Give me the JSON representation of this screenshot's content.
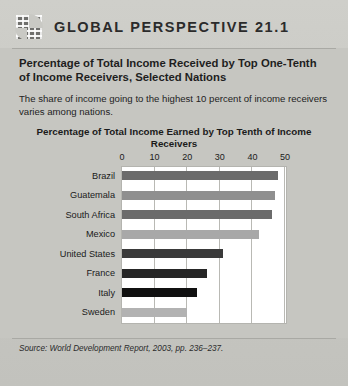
{
  "header": {
    "icon": "globe-grid-icon",
    "title": "GLOBAL PERSPECTIVE 21.1"
  },
  "box": {
    "subtitle": "Percentage of Total Income Received by Top One-Tenth of Income Receivers, Selected Nations",
    "lede": "The share of income going to the highest 10 percent of income receivers varies among nations.",
    "source": "Source: World Development Report, 2003, pp. 236–237."
  },
  "chart_data": {
    "type": "bar",
    "orientation": "horizontal",
    "title": "Percentage of Total Income Earned by Top Tenth of Income Receivers",
    "xlabel": "",
    "ylabel": "",
    "xlim": [
      0,
      50
    ],
    "xticks": [
      0,
      10,
      20,
      30,
      40,
      50
    ],
    "xtick_labels": [
      "0",
      "10",
      "20",
      "30",
      "40",
      "50"
    ],
    "grid": true,
    "legend": false,
    "categories": [
      "Brazil",
      "Guatemala",
      "South Africa",
      "Mexico",
      "United States",
      "France",
      "Italy",
      "Sweden"
    ],
    "values": [
      48,
      47,
      46,
      42,
      31,
      26,
      23,
      20
    ],
    "colors": [
      "#6b6b6b",
      "#8f8f8f",
      "#6b6b6b",
      "#a8a8a8",
      "#3a3a3a",
      "#262626",
      "#101010",
      "#b2b2b2"
    ]
  }
}
